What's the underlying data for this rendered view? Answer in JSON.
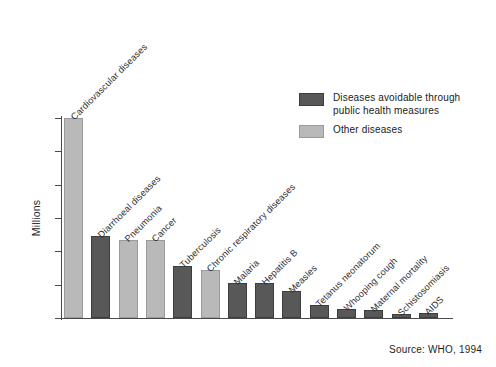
{
  "chart_data": {
    "type": "bar",
    "title": "",
    "xlabel": "",
    "ylabel": "Millions",
    "ylim": [
      0,
      12
    ],
    "ytick_values": [
      0,
      2,
      4,
      6,
      8,
      10,
      12
    ],
    "ytick_labels": [
      "0",
      "2",
      "4",
      "6",
      "8",
      "10",
      "12"
    ],
    "grid": false,
    "legend_position": "upper-right",
    "categories": [
      "Cardiovascular diseases",
      "Diarrhoeal diseases",
      "Pneumonia",
      "Cancer",
      "Tuberculosis",
      "Chronic respiratory diseases",
      "Malaria",
      "Hepatitis B",
      "Measles",
      "Tetanus neonatorum",
      "Whooping cough",
      "Maternal mortality",
      "Schistosomiasis",
      "AIDS"
    ],
    "values": [
      12.0,
      4.9,
      4.7,
      4.7,
      3.1,
      2.9,
      2.1,
      2.1,
      1.6,
      0.8,
      0.55,
      0.5,
      0.25,
      0.3
    ],
    "groups": [
      "other",
      "avoidable",
      "other",
      "other",
      "avoidable",
      "other",
      "avoidable",
      "avoidable",
      "avoidable",
      "avoidable",
      "avoidable",
      "avoidable",
      "avoidable",
      "avoidable"
    ],
    "series": [
      {
        "name": "Diseases avoidable through public health measures",
        "color": "#585858"
      },
      {
        "name": "Other diseases",
        "color": "#b9b9b9"
      }
    ],
    "annotations": [
      "Source: WHO, 1994"
    ]
  },
  "legend": {
    "items": [
      {
        "label": "Diseases avoidable through public health measures",
        "key": "avoidable",
        "color": "#585858"
      },
      {
        "label": "Other diseases",
        "key": "other",
        "color": "#b9b9b9"
      }
    ]
  },
  "footer": {
    "source": "Source: WHO, 1994"
  },
  "colors": {
    "avoidable": "#585858",
    "other": "#b9b9b9",
    "axis": "#4a4a4a",
    "text": "#2b2b2b",
    "background": "#ffffff"
  }
}
